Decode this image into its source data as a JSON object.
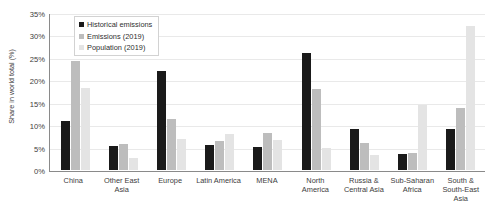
{
  "chart_data": {
    "type": "bar",
    "title": "",
    "xlabel": "",
    "ylabel": "Share in world total (%)",
    "ylim": [
      0,
      35
    ],
    "ytick_step": 5,
    "ytick_labels": [
      "0%",
      "5%",
      "10%",
      "15%",
      "20%",
      "25%",
      "30%",
      "35%"
    ],
    "grid": true,
    "legend_position": "top-left-inside",
    "categories": [
      "China",
      "Other East Asia",
      "Europe",
      "Latin America",
      "MENA",
      "North America",
      "Russia & Central Asia",
      "Sub-Saharan Africa",
      "South & South-East Asia"
    ],
    "series": [
      {
        "name": "Historical emissions",
        "color": "#1a1a1a",
        "values": [
          11.0,
          5.3,
          22.0,
          5.6,
          5.2,
          26.0,
          9.2,
          3.5,
          9.2
        ]
      },
      {
        "name": "Emissions (2019)",
        "color": "#bdbdbd",
        "values": [
          24.2,
          5.8,
          11.4,
          6.4,
          8.3,
          18.0,
          6.0,
          3.8,
          13.8
        ]
      },
      {
        "name": "Population (2019)",
        "color": "#e4e4e4",
        "values": [
          18.2,
          2.7,
          6.9,
          8.1,
          6.6,
          5.0,
          3.4,
          14.5,
          32.0
        ]
      }
    ]
  }
}
